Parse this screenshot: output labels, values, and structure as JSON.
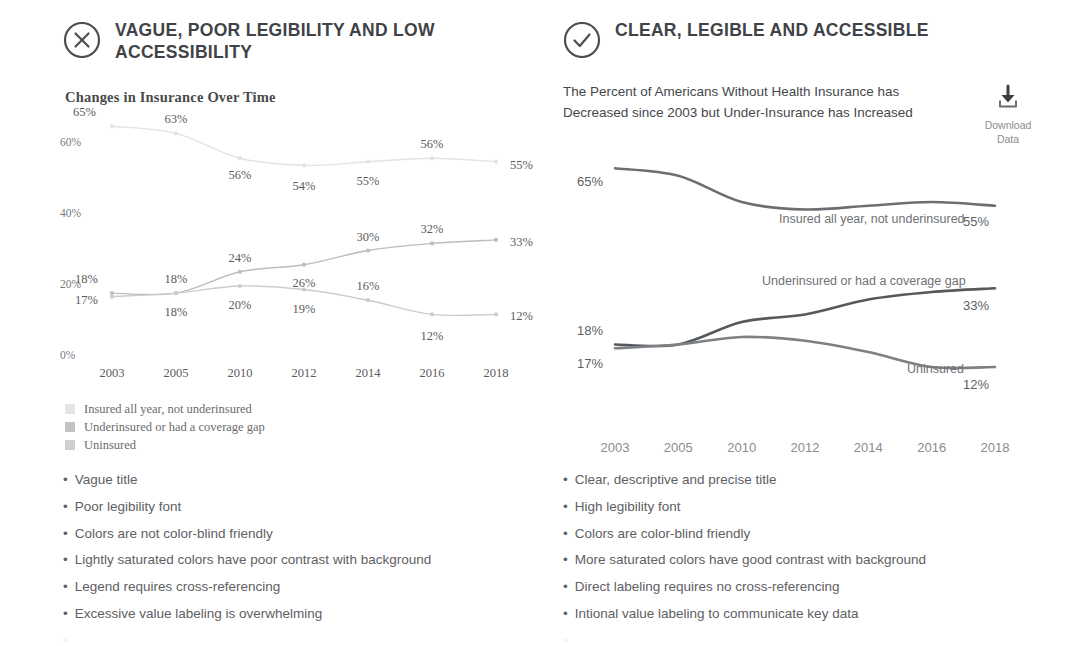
{
  "bad": {
    "icon": "circle-x-icon",
    "heading": "VAGUE, POOR LEGIBILITY AND LOW ACCESSIBILITY",
    "chart_title": "Changes in Insurance Over Time",
    "legend": [
      {
        "label": "Insured all year, not underinsured",
        "color": "#e4e4e4"
      },
      {
        "label": "Underinsured or had a coverage gap",
        "color": "#c3c3c3"
      },
      {
        "label": "Uninsured",
        "color": "#cfcfcf"
      }
    ],
    "bullets": [
      "Vague title",
      "Poor legibility font",
      "Colors are not color-blind friendly",
      "Lightly saturated colors have poor contrast with background",
      "Legend requires cross-referencing",
      "Excessive value labeling is overwhelming"
    ]
  },
  "good": {
    "icon": "circle-check-icon",
    "heading": "CLEAR, LEGIBLE AND ACCESSIBLE",
    "subtitle": "The Percent of Americans Without Health Insurance has Decreased since 2003 but Under-Insurance has Increased",
    "download": {
      "icon": "download-icon",
      "label": "Download Data"
    },
    "bullets": [
      "Clear, descriptive and precise title",
      "High legibility font",
      "Colors are color-blind friendly",
      "More saturated colors have good contrast with background",
      "Direct labeling requires no cross-referencing",
      "Intional value labeling to communicate key data"
    ]
  },
  "chart_data": [
    {
      "id": "bad_chart",
      "type": "line",
      "title": "Changes in Insurance Over Time",
      "xlabel": "",
      "ylabel": "",
      "categories": [
        "2003",
        "2005",
        "2010",
        "2012",
        "2014",
        "2016",
        "2018"
      ],
      "ytick_labels": [
        "0%",
        "20%",
        "40%",
        "60%"
      ],
      "yticks": [
        0,
        20,
        40,
        60
      ],
      "ylim": [
        0,
        70
      ],
      "grid": false,
      "legend_position": "below",
      "value_labels": true,
      "markers": true,
      "series": [
        {
          "name": "Insured all year, not underinsured",
          "color": "#e3e3e3",
          "values": [
            65,
            63,
            56,
            54,
            55,
            56,
            55
          ],
          "labels": [
            "65%",
            "63%",
            "56%",
            "54%",
            "55%",
            "56%",
            "55%"
          ]
        },
        {
          "name": "Underinsured or had a coverage gap",
          "color": "#bdbdbd",
          "values": [
            18,
            18,
            24,
            26,
            30,
            32,
            33
          ],
          "labels": [
            "18%",
            "18%",
            "24%",
            "26%",
            "30%",
            "32%",
            "33%"
          ]
        },
        {
          "name": "Uninsured",
          "color": "#cccccc",
          "values": [
            17,
            18,
            20,
            19,
            16,
            12,
            12
          ],
          "labels": [
            "17%",
            "18%",
            "20%",
            "19%",
            "16%",
            "12%",
            "12%"
          ]
        }
      ]
    },
    {
      "id": "good_chart",
      "type": "line",
      "title": "The Percent of Americans Without Health Insurance has Decreased since 2003 but Under-Insurance has Increased",
      "xlabel": "",
      "ylabel": "",
      "categories": [
        "2003",
        "2005",
        "2010",
        "2012",
        "2014",
        "2016",
        "2018"
      ],
      "ylim": [
        0,
        70
      ],
      "grid": false,
      "legend_position": "direct-label",
      "value_labels": "endpoints-only",
      "markers": false,
      "series": [
        {
          "name": "Insured all year, not underinsured",
          "color": "#6b6e72",
          "values": [
            65,
            63,
            56,
            54,
            55,
            56,
            55
          ],
          "start_label": "65%",
          "end_label": "55%"
        },
        {
          "name": "Underinsured or had a coverage gap",
          "color": "#55585c",
          "values": [
            18,
            18,
            24,
            26,
            30,
            32,
            33
          ],
          "start_label": "18%",
          "end_label": "33%"
        },
        {
          "name": "Uninsured",
          "color": "#7d8084",
          "values": [
            17,
            18,
            20,
            19,
            16,
            12,
            12
          ],
          "start_label": "17%",
          "end_label": "12%"
        }
      ]
    }
  ]
}
